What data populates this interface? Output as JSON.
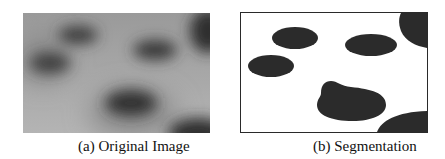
{
  "figure": {
    "panels": [
      {
        "id": "a",
        "caption": "(a) Original Image",
        "type": "grayscale-photo",
        "description": "Blurred gray image with dark elliptical blobs"
      },
      {
        "id": "b",
        "caption": "(b) Segmentation",
        "type": "binary-segmentation",
        "description": "Black blob regions on white background with border"
      }
    ],
    "colors": {
      "background_gray": "#a8a8a8",
      "blob_dark": "#2a2a2a",
      "seg_fill": "#2b2b2b",
      "seg_bg": "#ffffff"
    }
  }
}
